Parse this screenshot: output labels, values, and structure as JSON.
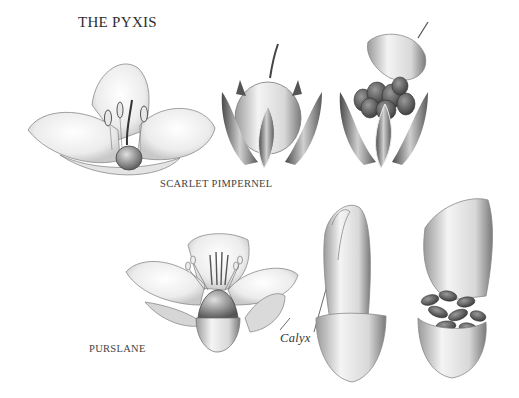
{
  "title": "THE PYXIS",
  "sections": [
    {
      "name": "SCARLET PIMPERNEL",
      "figures": [
        "open-flower",
        "closed-capsule",
        "open-capsule-with-seeds"
      ]
    },
    {
      "name": "PURSLANE",
      "figures": [
        "open-flower",
        "closed-capsule",
        "open-capsule-with-seeds"
      ]
    }
  ],
  "annotations": {
    "calyx": "Calyx"
  },
  "colors": {
    "background": "#ffffff",
    "ink": "#3a3a3a",
    "seed": "#4a4a4a"
  }
}
